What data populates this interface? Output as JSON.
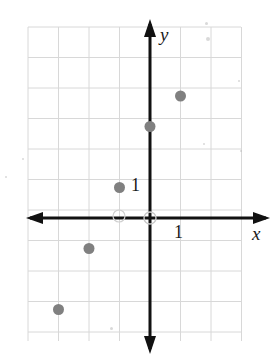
{
  "figure": {
    "background_color": "#ffffff",
    "width": 275,
    "height": 361
  },
  "axes": {
    "x_label": "x",
    "y_label": "y",
    "x_unit_label": "1",
    "y_unit_label": "1",
    "axis_color": "#111111",
    "grid_color": "#d8d8d8",
    "origin_px": {
      "x": 150,
      "y": 218
    },
    "grid_spacing_px": 30.5,
    "x_axis_start_px": 30,
    "x_axis_end_px": 266,
    "y_axis_top_px": 24,
    "y_axis_bottom_px": 349,
    "grid_left_px": 28,
    "grid_right_px": 241,
    "grid_top_px": 27,
    "grid_bottom_px": 341
  },
  "chart_data": {
    "type": "scatter",
    "title": "",
    "xlabel": "x",
    "ylabel": "y",
    "xlim": [
      -4,
      3
    ],
    "ylim": [
      -4,
      6
    ],
    "grid": true,
    "legend": "none",
    "point_color": "#808080",
    "point_radius_px": 5.5,
    "series": [
      {
        "name": "points",
        "points": [
          {
            "x": -3,
            "y": -3
          },
          {
            "x": -2,
            "y": -1
          },
          {
            "x": -1,
            "y": 1
          },
          {
            "x": 0,
            "y": 3
          },
          {
            "x": 1,
            "y": 4
          }
        ]
      }
    ],
    "x_tick_labeled": 1,
    "y_tick_labeled": 1
  },
  "artifacts": {
    "specks": [
      {
        "x": 205,
        "y": 22,
        "size": 3
      },
      {
        "x": 206,
        "y": 37,
        "size": 4
      },
      {
        "x": 238,
        "y": 80,
        "size": 2
      },
      {
        "x": 203,
        "y": 143,
        "size": 2
      },
      {
        "x": 240,
        "y": 150,
        "size": 2
      },
      {
        "x": 22,
        "y": 158,
        "size": 2
      },
      {
        "x": 110,
        "y": 327,
        "size": 3
      },
      {
        "x": 5,
        "y": 176,
        "size": 2
      }
    ]
  }
}
